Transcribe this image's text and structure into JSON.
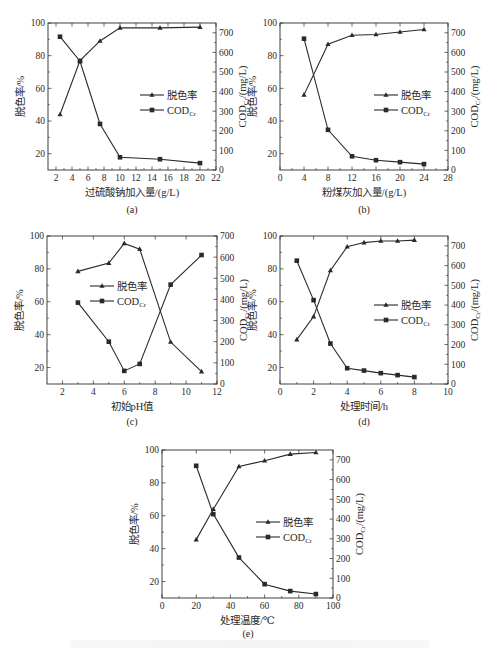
{
  "figure": {
    "legend_labels": {
      "decolor": "脱色率",
      "cod_main": "COD",
      "cod_sub": "Cr"
    },
    "left_axis_label": "脱色率/%",
    "right_axis_label_main": "COD",
    "right_axis_label_sub": "Cr",
    "right_axis_label_unit": "/(mg/L)"
  },
  "chart_data": [
    {
      "id": "a",
      "type": "line",
      "panel_label": "(a)",
      "title": "",
      "xlabel": "过硫酸钠加入量/(g/L)",
      "ylabel": "脱色率/%",
      "y2label": "COD_Cr/(mg/L)",
      "xlim": [
        1,
        22
      ],
      "xticks": [
        2,
        4,
        6,
        8,
        10,
        12,
        14,
        16,
        18,
        20,
        22
      ],
      "ylim": [
        10,
        100
      ],
      "yticks": [
        20,
        40,
        60,
        80,
        100
      ],
      "y2lim": [
        0,
        750
      ],
      "y2ticks": [
        0,
        100,
        200,
        300,
        400,
        500,
        600,
        700
      ],
      "grid": false,
      "legend_position": "center-right",
      "series": [
        {
          "name": "脱色率",
          "axis": "left",
          "marker": "triangle",
          "x": [
            2.5,
            5,
            7.5,
            10,
            15,
            20
          ],
          "values": [
            44,
            77,
            89,
            97,
            97,
            97.5
          ]
        },
        {
          "name": "COD_Cr",
          "axis": "right",
          "marker": "square",
          "x": [
            2.5,
            5,
            7.5,
            10,
            15,
            20
          ],
          "values": [
            680,
            555,
            235,
            65,
            55,
            35
          ]
        }
      ]
    },
    {
      "id": "b",
      "type": "line",
      "panel_label": "(b)",
      "title": "",
      "xlabel": "粉煤灰加入量/(g/L)",
      "ylabel": "脱色率/%",
      "y2label": "COD_Cr/(mg/L)",
      "xlim": [
        0,
        28
      ],
      "xticks": [
        0,
        4,
        8,
        12,
        16,
        20,
        24,
        28
      ],
      "ylim": [
        10,
        100
      ],
      "yticks": [
        20,
        40,
        60,
        80,
        100
      ],
      "y2lim": [
        0,
        750
      ],
      "y2ticks": [
        0,
        100,
        200,
        300,
        400,
        500,
        600,
        700
      ],
      "grid": false,
      "legend_position": "center-right",
      "series": [
        {
          "name": "脱色率",
          "axis": "left",
          "marker": "triangle",
          "x": [
            4,
            8,
            12,
            16,
            20,
            24
          ],
          "values": [
            56,
            87,
            92.5,
            93,
            94.5,
            96
          ]
        },
        {
          "name": "COD_Cr",
          "axis": "right",
          "marker": "square",
          "x": [
            4,
            8,
            12,
            16,
            20,
            24
          ],
          "values": [
            670,
            205,
            70,
            50,
            40,
            30
          ]
        }
      ]
    },
    {
      "id": "c",
      "type": "line",
      "panel_label": "(c)",
      "title": "",
      "xlabel": "初始pH值",
      "ylabel": "脱色率/%",
      "y2label": "COD_Cr/(mg/L)",
      "xlim": [
        1,
        12
      ],
      "xticks": [
        2,
        4,
        6,
        8,
        10,
        12
      ],
      "ylim": [
        10,
        100
      ],
      "yticks": [
        20,
        40,
        60,
        80,
        100
      ],
      "y2lim": [
        0,
        700
      ],
      "y2ticks": [
        0,
        100,
        200,
        300,
        400,
        500,
        600,
        700
      ],
      "grid": false,
      "legend_position": "center-left",
      "series": [
        {
          "name": "脱色率",
          "axis": "left",
          "marker": "triangle",
          "x": [
            3,
            5,
            6,
            7,
            9,
            11
          ],
          "values": [
            78.5,
            83.5,
            95.5,
            92,
            35.5,
            17.5
          ]
        },
        {
          "name": "COD_Cr",
          "axis": "right",
          "marker": "square",
          "x": [
            3,
            5,
            6,
            7,
            9,
            11
          ],
          "values": [
            385,
            200,
            62,
            95,
            470,
            610
          ]
        }
      ]
    },
    {
      "id": "d",
      "type": "line",
      "panel_label": "(d)",
      "title": "",
      "xlabel": "处理时间/h",
      "ylabel": "脱色率/%",
      "y2label": "COD_Cr/(mg/L)",
      "xlim": [
        0,
        10
      ],
      "xticks": [
        0,
        2,
        4,
        6,
        8,
        10
      ],
      "ylim": [
        10,
        100
      ],
      "yticks": [
        20,
        40,
        60,
        80,
        100
      ],
      "y2lim": [
        0,
        750
      ],
      "y2ticks": [
        0,
        100,
        200,
        300,
        400,
        500,
        600,
        700
      ],
      "grid": false,
      "legend_position": "center-right",
      "series": [
        {
          "name": "脱色率",
          "axis": "left",
          "marker": "triangle",
          "x": [
            1,
            2,
            3,
            4,
            5,
            6,
            7,
            8
          ],
          "values": [
            37,
            51,
            79,
            93.5,
            96,
            97,
            97,
            97.5
          ]
        },
        {
          "name": "COD_Cr",
          "axis": "right",
          "marker": "square",
          "x": [
            1,
            2,
            3,
            4,
            5,
            6,
            7,
            8
          ],
          "values": [
            625,
            425,
            205,
            80,
            68,
            55,
            45,
            35
          ]
        }
      ]
    },
    {
      "id": "e",
      "type": "line",
      "panel_label": "(e)",
      "title": "",
      "xlabel": "处理温度/℃",
      "ylabel": "脱色率/%",
      "y2label": "COD_Cr/(mg/L)",
      "xlim": [
        0,
        100
      ],
      "xticks": [
        0,
        20,
        40,
        60,
        80,
        100
      ],
      "ylim": [
        10,
        100
      ],
      "yticks": [
        20,
        40,
        60,
        80,
        100
      ],
      "y2lim": [
        0,
        750
      ],
      "y2ticks": [
        0,
        100,
        200,
        300,
        400,
        500,
        600,
        700
      ],
      "grid": false,
      "legend_position": "center-right",
      "series": [
        {
          "name": "脱色率",
          "axis": "left",
          "marker": "triangle",
          "x": [
            20,
            30,
            45,
            60,
            75,
            90
          ],
          "values": [
            45.5,
            64,
            90,
            93.5,
            97.5,
            98.5
          ]
        },
        {
          "name": "COD_Cr",
          "axis": "right",
          "marker": "square",
          "x": [
            20,
            30,
            45,
            60,
            75,
            90
          ],
          "values": [
            670,
            425,
            205,
            70,
            35,
            20
          ]
        }
      ]
    }
  ]
}
